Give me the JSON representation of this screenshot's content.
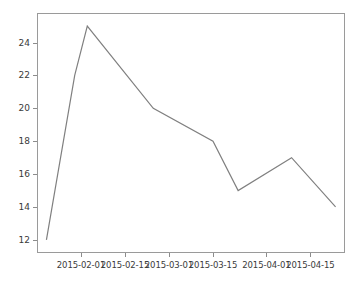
{
  "chart_data": {
    "type": "line",
    "title": "",
    "subtitle": "",
    "xlabel": "",
    "ylabel": "",
    "grid": false,
    "legend": null,
    "legend_position": "none",
    "line_color": "#808080",
    "line_width": 1.2,
    "marker": "none",
    "background_color": "#ffffff",
    "axes_color": "#9a9a9a",
    "tick_label_color": "#3a3a3a",
    "x_axis_type": "date",
    "xlim": [
      "2015-01-18",
      "2015-04-26"
    ],
    "ylim": [
      11.2,
      25.8
    ],
    "xticks": [
      "2015-02-01",
      "2015-02-15",
      "2015-03-01",
      "2015-03-15",
      "2015-04-01",
      "2015-04-15"
    ],
    "yticks": [
      12,
      14,
      16,
      18,
      20,
      22,
      24
    ],
    "ytick_labels": [
      "12",
      "14",
      "16",
      "18",
      "20",
      "22",
      "24"
    ],
    "x": [
      "2015-01-21",
      "2015-01-30",
      "2015-02-03",
      "2015-02-24",
      "2015-03-15",
      "2015-03-23",
      "2015-04-09",
      "2015-04-23"
    ],
    "values": [
      12,
      22,
      25,
      20,
      18,
      15,
      17,
      14
    ],
    "series": [
      {
        "name": "series-1",
        "color": "#808080",
        "values": [
          12,
          22,
          25,
          20,
          18,
          15,
          17,
          14
        ]
      }
    ],
    "annotations": []
  }
}
